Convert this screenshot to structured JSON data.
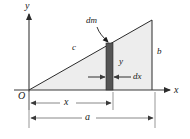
{
  "figure": {
    "type": "geometry-diagram",
    "axes": {
      "y_axis_label": "y",
      "x_axis_label": "x",
      "origin_label": "O"
    },
    "labels": {
      "dm": "dm",
      "hypotenuse": "c",
      "right_side": "b",
      "strip_height": "y",
      "strip_width": "dx",
      "dim_x": "x",
      "dim_a": "a"
    },
    "colors": {
      "triangle_fill": "#ededed",
      "strip_fill": "#555555",
      "line": "#2b2b2b",
      "dim_line": "#6b6b6b",
      "text": "#1a1a1a",
      "background": "#ffffff"
    },
    "geometry": {
      "origin": [
        29,
        90
      ],
      "apex": [
        152,
        20
      ],
      "base_right": [
        152,
        90
      ],
      "strip_left": 106,
      "strip_right": 113,
      "strip_top": 43,
      "strip_bottom": 90,
      "dim_x_y": 103,
      "dim_a_y": 118,
      "dx_arrow_y": 77
    }
  }
}
